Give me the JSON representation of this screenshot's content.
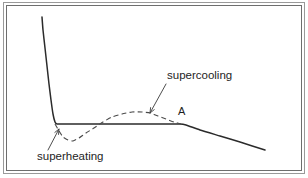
{
  "figure": {
    "name": "cooling-curve-with-supercooling-and-superheating",
    "background_color": "#ffffff",
    "frame": {
      "outer_border_color": "#9a9a9a",
      "inner_border_color": "#6e6e6e"
    }
  },
  "annotations": {
    "supercooling_label": "supercooling",
    "superheating_label": "superheating",
    "point_a_label": "A"
  },
  "colors": {
    "solid_curve": "#2b2b2b",
    "dashed_curve": "#4a4a4a",
    "leader_line": "#3a3a3a",
    "text": "#1e1e1e"
  },
  "chart_data": {
    "type": "line",
    "title": "",
    "subtitle": "",
    "xlabel": "",
    "ylabel": "",
    "grid": false,
    "legend_position": "none",
    "axis_visible": false,
    "xlim": [
      0,
      308
    ],
    "ylim": [
      178,
      0
    ],
    "note": "Schematic thermal analysis curve: temperature versus time. Solid line is the ideal/equilibrium path (steep cooling, isothermal plateau, then gradual decline). Dashed line is the real path showing a superheating dip below the plateau at the start and a supercooling hump above the plateau before rejoining at point A.",
    "series": [
      {
        "name": "ideal-curve-solid",
        "style": "solid",
        "color": "#2b2b2b",
        "points": [
          [
            42,
            17
          ],
          [
            43,
            30
          ],
          [
            45,
            48
          ],
          [
            47,
            66
          ],
          [
            49,
            84
          ],
          [
            51,
            100
          ],
          [
            53,
            114
          ],
          [
            55,
            122
          ],
          [
            57,
            124
          ],
          [
            70,
            124
          ],
          [
            100,
            124
          ],
          [
            130,
            124
          ],
          [
            160,
            124
          ],
          [
            180,
            124
          ],
          [
            186,
            125
          ],
          [
            200,
            130
          ],
          [
            220,
            136
          ],
          [
            240,
            142
          ],
          [
            265,
            150
          ]
        ]
      },
      {
        "name": "real-curve-dashed",
        "style": "dashed",
        "color": "#4a4a4a",
        "points": [
          [
            55,
            124
          ],
          [
            59,
            131
          ],
          [
            63,
            137
          ],
          [
            68,
            140
          ],
          [
            73,
            141
          ],
          [
            79,
            138
          ],
          [
            86,
            133
          ],
          [
            94,
            128
          ],
          [
            103,
            122
          ],
          [
            112,
            117
          ],
          [
            122,
            114
          ],
          [
            132,
            112
          ],
          [
            142,
            112
          ],
          [
            150,
            113
          ],
          [
            158,
            116
          ],
          [
            166,
            119
          ],
          [
            174,
            122
          ],
          [
            181,
            124
          ]
        ]
      }
    ],
    "annotations": [
      {
        "text": "supercooling",
        "text_position": [
          167,
          76
        ],
        "leader_from": [
          166,
          84
        ],
        "leader_to": [
          150,
          113
        ],
        "arrow": true
      },
      {
        "text": "superheating",
        "text_position": [
          37,
          157
        ],
        "leader_from": [
          48,
          150
        ],
        "leader_to": [
          59,
          129
        ],
        "arrow": true
      },
      {
        "text": "A",
        "text_position": [
          180,
          112
        ],
        "leader_from": null,
        "leader_to": null,
        "arrow": false
      }
    ]
  }
}
